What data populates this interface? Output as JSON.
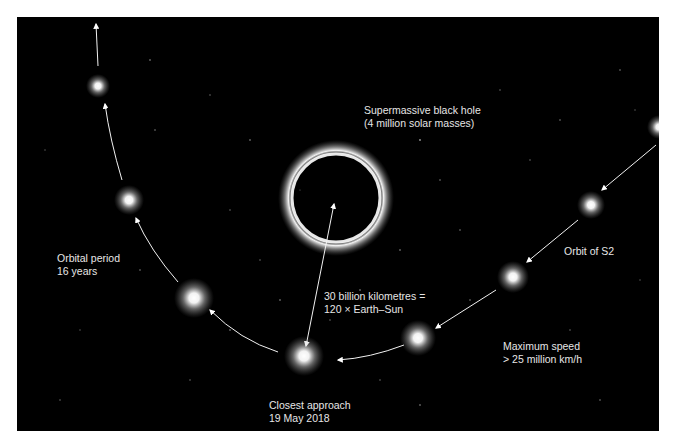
{
  "figure": {
    "background": "#000000",
    "star_color": "#ffffff",
    "text_color": "#e6e6e6"
  },
  "black_hole": {
    "title": "Supermassive black hole",
    "subtitle": "(4 million solar masses)"
  },
  "distance": {
    "line1": "30 billion kilometres =",
    "line2": "120 × Earth–Sun"
  },
  "closest_approach": {
    "line1": "Closest approach",
    "line2": "19 May 2018"
  },
  "max_speed": {
    "line1": "Maximum speed",
    "line2": "> 25 million km/h"
  },
  "orbital_period": {
    "line1": "Orbital period",
    "line2": "16 years"
  },
  "orbit_label": "Orbit of S2",
  "star_positions": [
    {
      "x": 98,
      "y": 86,
      "r": 12
    },
    {
      "x": 129,
      "y": 200,
      "r": 15
    },
    {
      "x": 194,
      "y": 298,
      "r": 20
    },
    {
      "x": 304,
      "y": 356,
      "r": 20
    },
    {
      "x": 418,
      "y": 338,
      "r": 18
    },
    {
      "x": 513,
      "y": 277,
      "r": 16
    },
    {
      "x": 591,
      "y": 205,
      "r": 14
    },
    {
      "x": 657,
      "y": 127,
      "r": 12
    }
  ]
}
